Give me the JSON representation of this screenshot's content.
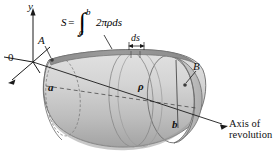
{
  "figure": {
    "caption_type": "surface-of-revolution-diagram",
    "background_color": "#ffffff",
    "axes": {
      "y_label": "y",
      "origin_label": "0",
      "axis_of_revolution_line1": "Axis of",
      "axis_of_revolution_line2": "revolution"
    },
    "formula": {
      "lhs": "S",
      "equals": "=",
      "integral_sign": "∫",
      "upper_limit": "b",
      "lower_limit": "a",
      "integrand": "2πρds"
    },
    "labels": {
      "point_a": "A",
      "point_b": "B",
      "radius_a": "a",
      "radius_b": "b",
      "rho": "ρ",
      "ds": "ds"
    },
    "colors": {
      "surface_light": "#d8d8d8",
      "surface_mid": "#c0c0c0",
      "surface_dark": "#a6a6a6",
      "band_dark": "#8f8f8f",
      "outline": "#5a5a5a",
      "ink": "#111111"
    }
  }
}
